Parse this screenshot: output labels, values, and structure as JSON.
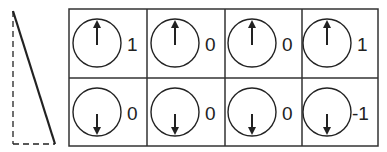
{
  "colors": {
    "stroke": "#222222",
    "background": "#ffffff"
  },
  "side_figure": {
    "type": "triangle",
    "solid": "hypotenuse",
    "dashed": [
      "vertical-leg",
      "bottom-leg"
    ]
  },
  "grid": {
    "rows": 2,
    "cols": 4,
    "cells": [
      {
        "row": 0,
        "col": 0,
        "arrow": "up",
        "value": "1"
      },
      {
        "row": 0,
        "col": 1,
        "arrow": "up",
        "value": "0"
      },
      {
        "row": 0,
        "col": 2,
        "arrow": "up",
        "value": "0"
      },
      {
        "row": 0,
        "col": 3,
        "arrow": "up",
        "value": "1"
      },
      {
        "row": 1,
        "col": 0,
        "arrow": "down",
        "value": "0"
      },
      {
        "row": 1,
        "col": 1,
        "arrow": "down",
        "value": "0"
      },
      {
        "row": 1,
        "col": 2,
        "arrow": "down",
        "value": "0"
      },
      {
        "row": 1,
        "col": 3,
        "arrow": "down",
        "value": "-1"
      }
    ]
  }
}
